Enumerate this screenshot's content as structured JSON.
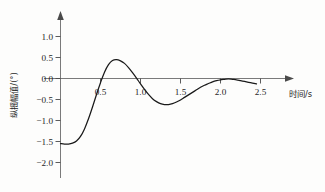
{
  "chart_data": {
    "type": "line",
    "title": "",
    "subtitle": "",
    "xlabel": "时间/s",
    "ylabel": "纵摇幅值/(°)",
    "xlim": [
      0,
      2.9
    ],
    "ylim": [
      -2.0,
      1.15
    ],
    "xticks": [
      0.5,
      1.0,
      1.5,
      2.0,
      2.5
    ],
    "xtick_labels": [
      "0.5",
      "1.0",
      "1.5",
      "2.0",
      "2.5"
    ],
    "yticks": [
      1.0,
      0.5,
      0.0,
      -0.5,
      -1.0,
      -1.5,
      -2.0
    ],
    "ytick_labels": [
      "1.0",
      "0.5",
      "0.0",
      "−0.5",
      "−1.0",
      "−1.5",
      "−2.0"
    ],
    "grid": false,
    "legend": null,
    "legend_position": "none",
    "annotations": [],
    "series": [
      {
        "name": "纵摇幅值",
        "color": "#1a1a1a",
        "x": [
          0.0,
          0.05,
          0.1,
          0.15,
          0.2,
          0.25,
          0.3,
          0.35,
          0.4,
          0.45,
          0.5,
          0.55,
          0.6,
          0.65,
          0.7,
          0.75,
          0.8,
          0.85,
          0.9,
          0.95,
          1.0,
          1.05,
          1.1,
          1.15,
          1.2,
          1.25,
          1.3,
          1.35,
          1.4,
          1.45,
          1.5,
          1.55,
          1.6,
          1.65,
          1.7,
          1.75,
          1.8,
          1.85,
          1.9,
          1.95,
          2.0,
          2.05,
          2.1,
          2.15,
          2.2,
          2.25,
          2.3,
          2.35,
          2.4,
          2.45
        ],
        "y": [
          -1.55,
          -1.56,
          -1.56,
          -1.54,
          -1.49,
          -1.38,
          -1.2,
          -0.96,
          -0.68,
          -0.38,
          -0.1,
          0.15,
          0.33,
          0.43,
          0.45,
          0.42,
          0.36,
          0.26,
          0.14,
          0.01,
          -0.13,
          -0.26,
          -0.38,
          -0.48,
          -0.55,
          -0.6,
          -0.62,
          -0.62,
          -0.6,
          -0.56,
          -0.51,
          -0.45,
          -0.39,
          -0.33,
          -0.27,
          -0.21,
          -0.16,
          -0.12,
          -0.08,
          -0.05,
          -0.03,
          -0.02,
          -0.01,
          -0.02,
          -0.03,
          -0.05,
          -0.07,
          -0.09,
          -0.11,
          -0.13
        ]
      }
    ],
    "features": {
      "start_value": -1.55,
      "first_peak_time": 0.7,
      "first_peak_value": 0.45,
      "first_zero_crossing": 0.52,
      "second_zero_crossing": 0.96,
      "trough_time": 1.33,
      "trough_value": -0.62,
      "second_peak_time": 2.1,
      "second_peak_value": -0.01,
      "end_time": 2.45,
      "end_value": -0.13
    }
  },
  "axes": {
    "y_axis_title": "纵摇幅值/(°)",
    "x_axis_title": "时间/s"
  }
}
